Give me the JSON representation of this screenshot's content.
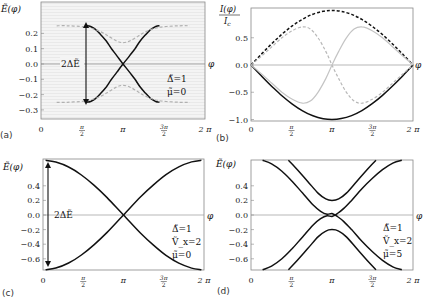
{
  "figure": {
    "panels": [
      "(a)",
      "(b)",
      "(c)",
      "(d)"
    ]
  },
  "chart_data": [
    {
      "panel": "(a)",
      "type": "line",
      "ylabel": "Ẽ(φ)",
      "xlabel": "φ",
      "xticks": [
        "0",
        "π/2",
        "π",
        "3π/2",
        "2π"
      ],
      "yticks": [
        "0.2",
        "0.1",
        "0.0",
        "-0.1",
        "-0.2",
        "-0.3"
      ],
      "ytick_values": [
        0.2,
        0.1,
        0.0,
        -0.1,
        -0.2,
        -0.3
      ],
      "xlim": [
        0,
        6.2832
      ],
      "ylim": [
        -0.36,
        0.405
      ],
      "background": "light gray striped",
      "annotations": [
        "2ΔẼ",
        "Δ̃=1",
        "μ̃=0"
      ],
      "series": [
        {
          "name": "upper-black",
          "style": "solid",
          "color": "#111111",
          "x": [
            1.74,
            1.9,
            2.1,
            2.3,
            2.5,
            2.7,
            2.9,
            3.1416,
            3.4,
            3.6,
            3.8,
            4.0,
            4.2,
            4.4,
            4.54
          ],
          "y": [
            0.25,
            0.245,
            0.225,
            0.19,
            0.15,
            0.1,
            0.055,
            0.0,
            -0.055,
            -0.1,
            -0.15,
            -0.19,
            -0.225,
            -0.245,
            -0.25
          ]
        },
        {
          "name": "lower-black",
          "style": "solid",
          "color": "#111111",
          "x": [
            1.74,
            1.9,
            2.1,
            2.3,
            2.5,
            2.7,
            2.9,
            3.1416,
            3.4,
            3.6,
            3.8,
            4.0,
            4.2,
            4.4,
            4.54
          ],
          "y": [
            -0.25,
            -0.245,
            -0.225,
            -0.19,
            -0.15,
            -0.1,
            -0.055,
            0.0,
            0.055,
            0.1,
            0.15,
            0.19,
            0.225,
            0.245,
            0.25
          ]
        },
        {
          "name": "upper-gray",
          "style": "dashed",
          "color": "#b0b0b0",
          "x": [
            0.6,
            1.0,
            1.5,
            1.9,
            2.3,
            2.6,
            2.9,
            3.1416,
            3.4,
            3.7,
            4.0,
            4.4,
            4.8,
            5.3,
            5.7
          ],
          "y": [
            0.25,
            0.25,
            0.245,
            0.235,
            0.21,
            0.18,
            0.15,
            0.14,
            0.15,
            0.18,
            0.21,
            0.235,
            0.245,
            0.25,
            0.25
          ]
        },
        {
          "name": "lower-gray",
          "style": "dashed",
          "color": "#b0b0b0",
          "x": [
            0.6,
            1.0,
            1.5,
            1.9,
            2.3,
            2.6,
            2.9,
            3.1416,
            3.4,
            3.7,
            4.0,
            4.4,
            4.8,
            5.3,
            5.7
          ],
          "y": [
            -0.25,
            -0.25,
            -0.245,
            -0.235,
            -0.21,
            -0.18,
            -0.15,
            -0.14,
            -0.15,
            -0.18,
            -0.21,
            -0.235,
            -0.245,
            -0.25,
            -0.25
          ]
        }
      ]
    },
    {
      "panel": "(b)",
      "type": "line",
      "ylabel": "I(φ)/I_c",
      "xlabel": "φ",
      "xticks": [
        "0",
        "π/2",
        "π",
        "3π/2",
        "2π"
      ],
      "yticks": [
        "0.5",
        "0.0",
        "-0.5",
        "-1.0"
      ],
      "ytick_values": [
        0.5,
        0.0,
        -0.5,
        -1.0
      ],
      "xlim": [
        0,
        6.2832
      ],
      "ylim": [
        -1.02,
        1.05
      ],
      "series": [
        {
          "name": "black-dashed",
          "style": "dashed",
          "color": "#111111",
          "x": [
            0,
            0.4,
            0.8,
            1.2,
            1.6,
            2.0,
            2.4,
            2.8,
            3.1416,
            3.5,
            3.9,
            4.3,
            4.7,
            5.1,
            5.5,
            5.9,
            6.2832
          ],
          "y": [
            0,
            0.199,
            0.389,
            0.565,
            0.717,
            0.841,
            0.932,
            0.985,
            1.0,
            0.984,
            0.929,
            0.837,
            0.711,
            0.557,
            0.381,
            0.19,
            0
          ]
        },
        {
          "name": "black-solid",
          "style": "solid",
          "color": "#111111",
          "x": [
            0,
            0.4,
            0.8,
            1.2,
            1.6,
            2.0,
            2.4,
            2.8,
            3.1416,
            3.5,
            3.9,
            4.3,
            4.7,
            5.1,
            5.5,
            5.9,
            6.2832
          ],
          "y": [
            0,
            -0.199,
            -0.389,
            -0.565,
            -0.717,
            -0.841,
            -0.932,
            -0.985,
            -1.0,
            -0.984,
            -0.929,
            -0.837,
            -0.711,
            -0.557,
            -0.381,
            -0.19,
            0
          ]
        },
        {
          "name": "gray-dashed",
          "style": "dashed",
          "color": "#b8b8b8",
          "x": [
            0,
            0.4,
            0.8,
            1.2,
            1.6,
            2.0,
            2.3,
            2.6,
            2.9,
            3.1416,
            3.4,
            3.7,
            4.0,
            4.3,
            4.7,
            5.1,
            5.5,
            5.9,
            6.2832
          ],
          "y": [
            0,
            0.16,
            0.33,
            0.5,
            0.63,
            0.7,
            0.66,
            0.5,
            0.25,
            0,
            -0.25,
            -0.5,
            -0.66,
            -0.7,
            -0.63,
            -0.5,
            -0.33,
            -0.16,
            0
          ]
        },
        {
          "name": "gray-solid",
          "style": "solid",
          "color": "#c4c4c4",
          "x": [
            0,
            0.4,
            0.8,
            1.2,
            1.6,
            2.0,
            2.3,
            2.6,
            2.9,
            3.1416,
            3.4,
            3.7,
            4.0,
            4.3,
            4.7,
            5.1,
            5.5,
            5.9,
            6.2832
          ],
          "y": [
            0,
            -0.16,
            -0.33,
            -0.5,
            -0.63,
            -0.7,
            -0.66,
            -0.5,
            -0.25,
            0,
            0.25,
            0.5,
            0.66,
            0.7,
            0.63,
            0.5,
            0.33,
            0.16,
            0
          ]
        }
      ]
    },
    {
      "panel": "(c)",
      "type": "line",
      "ylabel": "Ẽ(φ)",
      "xlabel": "φ",
      "xticks": [
        "0",
        "π/2",
        "π",
        "3π/2",
        "2π"
      ],
      "yticks": [
        "0.4",
        "0.2",
        "0.0",
        "-0.2",
        "-0.4",
        "-0.6"
      ],
      "ytick_values": [
        0.4,
        0.2,
        0.0,
        -0.2,
        -0.4,
        -0.6
      ],
      "xlim": [
        0,
        6.2832
      ],
      "ylim": [
        -0.75,
        0.77
      ],
      "annotations": [
        "2ΔẼ",
        "Δ̃=1",
        "Ṽ_x=2",
        "μ̃=0"
      ],
      "series": [
        {
          "name": "upper",
          "style": "solid",
          "color": "#111111",
          "x": [
            0.1,
            0.5,
            1.0,
            1.5,
            2.0,
            2.5,
            3.1416,
            3.8,
            4.3,
            4.8,
            5.3,
            5.8,
            6.18
          ],
          "y": [
            0.75,
            0.726,
            0.658,
            0.548,
            0.405,
            0.238,
            0.0,
            -0.246,
            -0.41,
            -0.553,
            -0.66,
            -0.727,
            -0.75
          ]
        },
        {
          "name": "lower",
          "style": "solid",
          "color": "#111111",
          "x": [
            0.1,
            0.5,
            1.0,
            1.5,
            2.0,
            2.5,
            3.1416,
            3.8,
            4.3,
            4.8,
            5.3,
            5.8,
            6.18
          ],
          "y": [
            -0.75,
            -0.726,
            -0.658,
            -0.548,
            -0.405,
            -0.238,
            0.0,
            0.246,
            0.41,
            0.553,
            0.66,
            0.727,
            0.75
          ]
        }
      ]
    },
    {
      "panel": "(d)",
      "type": "line",
      "ylabel": "Ẽ(φ)",
      "xlabel": "φ",
      "xticks": [
        "0",
        "π/2",
        "π",
        "3π/2",
        "2π"
      ],
      "yticks": [
        "0.4",
        "0.2",
        "0.0",
        "-0.2",
        "-0.4",
        "-0.6"
      ],
      "ytick_values": [
        0.4,
        0.2,
        0.0,
        -0.2,
        -0.4,
        -0.6
      ],
      "xlim": [
        0,
        6.2832
      ],
      "ylim": [
        -0.75,
        0.77
      ],
      "annotations": [
        "Δ̃=1",
        "Ṽ_x=2",
        "μ̃=5"
      ],
      "series": [
        {
          "name": "outer-down",
          "style": "solid",
          "color": "#111111",
          "x": [
            0.45,
            0.8,
            1.2,
            1.6,
            2.0,
            2.4,
            2.7,
            2.95,
            3.1416,
            3.35,
            3.6,
            3.9,
            4.3,
            4.7,
            5.1,
            5.5,
            5.85
          ],
          "y": [
            0.75,
            0.7,
            0.6,
            0.46,
            0.3,
            0.14,
            0.05,
            0.01,
            0.02,
            -0.02,
            -0.09,
            -0.2,
            -0.36,
            -0.5,
            -0.62,
            -0.71,
            -0.75
          ]
        },
        {
          "name": "outer-up",
          "style": "solid",
          "color": "#111111",
          "x": [
            0.45,
            0.8,
            1.2,
            1.6,
            2.0,
            2.4,
            2.7,
            2.95,
            3.1416,
            3.35,
            3.6,
            3.9,
            4.3,
            4.7,
            5.1,
            5.5,
            5.85
          ],
          "y": [
            -0.75,
            -0.7,
            -0.6,
            -0.46,
            -0.3,
            -0.14,
            -0.05,
            -0.01,
            -0.02,
            0.02,
            0.09,
            0.2,
            0.36,
            0.5,
            0.62,
            0.71,
            0.75
          ]
        },
        {
          "name": "inner-upper",
          "style": "solid",
          "color": "#111111",
          "x": [
            1.45,
            1.8,
            2.2,
            2.6,
            2.9,
            3.1416,
            3.4,
            3.7,
            4.1,
            4.5,
            4.85
          ],
          "y": [
            0.75,
            0.62,
            0.46,
            0.3,
            0.22,
            0.2,
            0.22,
            0.3,
            0.46,
            0.62,
            0.75
          ]
        },
        {
          "name": "inner-lower",
          "style": "solid",
          "color": "#111111",
          "x": [
            1.45,
            1.8,
            2.2,
            2.6,
            2.9,
            3.1416,
            3.4,
            3.7,
            4.1,
            4.5,
            4.85
          ],
          "y": [
            -0.75,
            -0.62,
            -0.46,
            -0.3,
            -0.22,
            -0.2,
            -0.22,
            -0.3,
            -0.46,
            -0.62,
            -0.75
          ]
        }
      ]
    }
  ]
}
